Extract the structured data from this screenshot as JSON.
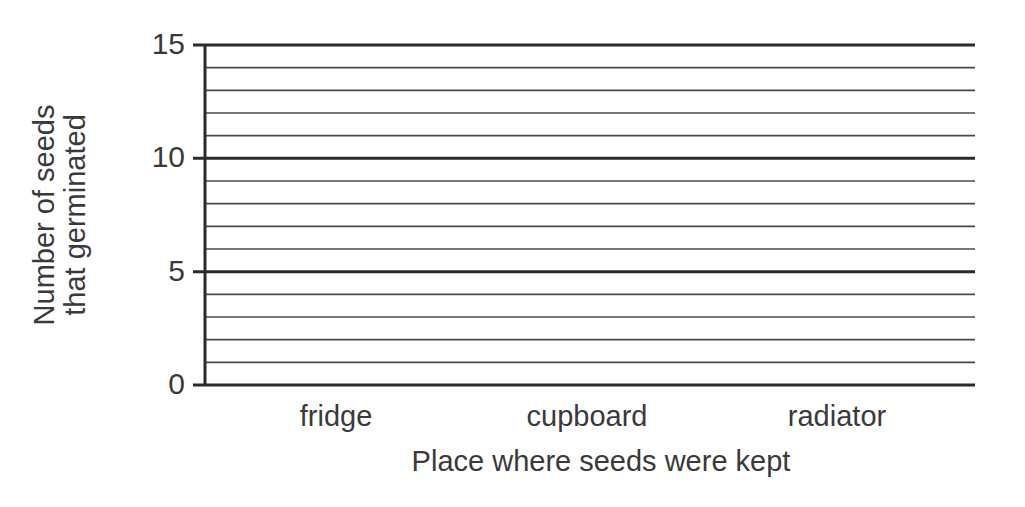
{
  "chart_data": {
    "type": "bar",
    "title": "",
    "xlabel": "Place where seeds were kept",
    "ylabel_lines": [
      "Number of seeds",
      "that germinated"
    ],
    "ylabel": "Number of seeds that germinated",
    "categories": [
      "fridge",
      "cupboard",
      "radiator"
    ],
    "values": [
      null,
      null,
      null
    ],
    "series": [],
    "ylim": [
      0,
      15
    ],
    "yticks": [
      0,
      5,
      10,
      15
    ],
    "minor_step": 1,
    "major_step": 5,
    "grid": true,
    "legend": null,
    "note": "Blank grid for a bar chart; no data plotted"
  },
  "colors": {
    "major_line": "#2a2a2a",
    "minor_line": "#4a4a4a",
    "text": "#3a3a3a"
  },
  "layout": {
    "plot_left": 205,
    "plot_right": 975,
    "plot_top": 45,
    "plot_bottom": 385,
    "tick_left": 193,
    "category_x": [
      336,
      587,
      837
    ],
    "category_y": 402,
    "xlabel_x": 601,
    "xlabel_y": 447
  }
}
